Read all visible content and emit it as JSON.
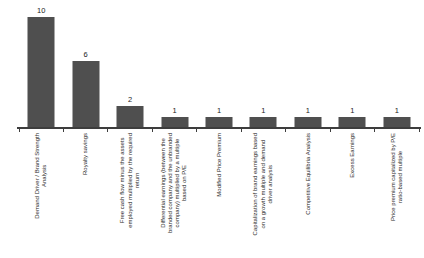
{
  "chart_data": {
    "type": "bar",
    "title": "",
    "categories": [
      "Demand Driver / Brand Strength\nAnalysis",
      "Royalty savings",
      "Free cash flow minus the assets\nemployed multiplied by the required\nreturn",
      "Differential earnings (between the\nbranded company and the unbranded\ncompany) multiplied by a multiple\nbased on P/E",
      "Modified Price Premium",
      "Capitalization of brand earnings based\non a growth multiple and demand\ndriver analysis",
      "Competitive Equilibria Analysis",
      "Excess Earnings",
      "Price premium capitalized by P/E\nratio-based multiple"
    ],
    "values": [
      10,
      6,
      2,
      1,
      1,
      1,
      1,
      1,
      1
    ],
    "xlabel": "",
    "ylabel": "",
    "ylim": [
      0,
      10.5
    ],
    "grid": false,
    "legend": false,
    "value_labels_shown": true,
    "x_tick_rotation_degrees": 90,
    "bar_color": "#4f4f4f",
    "axis_color": "#3d3d3d",
    "label_color": "#2a2a2a",
    "background_color": "#ffffff"
  }
}
